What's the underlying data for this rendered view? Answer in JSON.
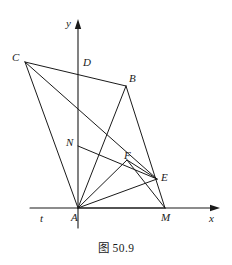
{
  "figure": {
    "caption": "图 50.9",
    "caption_position": {
      "x": 0,
      "y": 239
    },
    "background_color": "#ffffff",
    "stroke_color": "#1a1a1a",
    "text_color": "#1a1a1a"
  },
  "axes": {
    "x_axis": {
      "label": "x",
      "label_position": {
        "x": 209,
        "y": 213
      },
      "start": {
        "x": 30,
        "y": 208
      },
      "end": {
        "x": 214,
        "y": 208
      },
      "arrow": "right"
    },
    "y_axis": {
      "label": "y",
      "label_position": {
        "x": 66,
        "y": 18
      },
      "start": {
        "x": 78,
        "y": 228
      },
      "end": {
        "x": 78,
        "y": 25
      },
      "arrow": "up"
    },
    "tangent_label": {
      "label": "t",
      "label_position": {
        "x": 40,
        "y": 213
      }
    }
  },
  "points": [
    {
      "name": "C",
      "label": "C",
      "x": 25,
      "y": 62,
      "label_x": 12,
      "label_y": 52
    },
    {
      "name": "D",
      "label": "D",
      "x": 78,
      "y": 66,
      "label_x": 83,
      "label_y": 57
    },
    {
      "name": "B",
      "label": "B",
      "x": 126,
      "y": 86,
      "label_x": 129,
      "label_y": 73
    },
    {
      "name": "N",
      "label": "N",
      "x": 78,
      "y": 146,
      "label_x": 66,
      "label_y": 137
    },
    {
      "name": "F",
      "label": "F",
      "x": 127,
      "y": 160,
      "label_x": 124,
      "label_y": 150
    },
    {
      "name": "E",
      "label": "E",
      "x": 157,
      "y": 179,
      "label_x": 161,
      "label_y": 172
    },
    {
      "name": "A",
      "label": "A",
      "x": 78,
      "y": 208,
      "label_x": 71,
      "label_y": 212
    },
    {
      "name": "M",
      "label": "M",
      "x": 165,
      "y": 208,
      "label_x": 161,
      "label_y": 212
    }
  ],
  "segments": [
    {
      "name": "C-B",
      "from": "C",
      "to": "B"
    },
    {
      "name": "C-A",
      "from": "C",
      "to": "A"
    },
    {
      "name": "C-E",
      "from": "C",
      "to": "E"
    },
    {
      "name": "B-A",
      "from": "B",
      "to": "A"
    },
    {
      "name": "B-M",
      "from": "B",
      "to": "M"
    },
    {
      "name": "N-E",
      "from": "N",
      "to": "E"
    },
    {
      "name": "A-F",
      "from": "A",
      "to": "F"
    },
    {
      "name": "A-E",
      "from": "A",
      "to": "E"
    },
    {
      "name": "A-M",
      "from": "A",
      "to": "M"
    },
    {
      "name": "F-M",
      "from": "F",
      "to": "M"
    },
    {
      "name": "F-E",
      "from": "F",
      "to": "E"
    }
  ]
}
